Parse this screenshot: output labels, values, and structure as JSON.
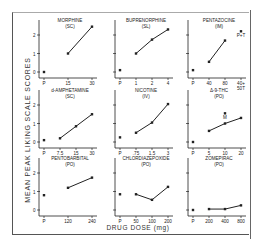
{
  "chart_data": {
    "type": "line",
    "layout": "3x3 small multiples",
    "ylabel": "MEAN PEAK LIKING SCALE SCORES",
    "xlabel": "DRUG DOSE (mg)",
    "ylim": [
      0,
      2.5
    ],
    "yticks": [
      0,
      1,
      2
    ],
    "grid": false,
    "panels": [
      {
        "title": "MORPHINE",
        "route": "(SC)",
        "x_ticks": [
          "P",
          "15",
          "30"
        ],
        "placebo": 0.0,
        "series": [
          {
            "x": "15",
            "y": 1.0
          },
          {
            "x": "30",
            "y": 2.45
          }
        ],
        "show_ytick_labels": true
      },
      {
        "title": "BUPRENORPHINE",
        "route": "(SL)",
        "x_ticks": [
          "P",
          "1",
          "2",
          "4"
        ],
        "placebo": 0.1,
        "series": [
          {
            "x": "1",
            "y": 1.0
          },
          {
            "x": "2",
            "y": 1.75
          },
          {
            "x": "4",
            "y": 2.3
          }
        ],
        "show_ytick_labels": false
      },
      {
        "title": "PENTAZOCINE",
        "route": "(IM)",
        "x_ticks": [
          "P",
          "40",
          "80",
          "40+\n50T"
        ],
        "placebo": 0.1,
        "series": [
          {
            "x": "40",
            "y": 0.55
          },
          {
            "x": "80",
            "y": 1.7
          }
        ],
        "extra_points": [
          {
            "x": "40+\n50T",
            "y": 2.2,
            "label": "P+T"
          }
        ],
        "show_ytick_labels": false
      },
      {
        "title": "d-AMPHETAMINE",
        "route": "(SC)",
        "x_ticks": [
          "P",
          "7.5",
          "15",
          "30"
        ],
        "placebo": 0.1,
        "series": [
          {
            "x": "7.5",
            "y": 0.2
          },
          {
            "x": "15",
            "y": 0.85
          },
          {
            "x": "30",
            "y": 1.5
          }
        ],
        "show_ytick_labels": true
      },
      {
        "title": "NICOTINE",
        "route": "(IV)",
        "x_ticks": [
          "P",
          ".75",
          "1.5",
          "3"
        ],
        "placebo": 0.25,
        "series": [
          {
            "x": ".75",
            "y": 0.5
          },
          {
            "x": "1.5",
            "y": 1.05
          },
          {
            "x": "3",
            "y": 2.05
          }
        ],
        "show_ytick_labels": false
      },
      {
        "title": "Δ-9-THC",
        "route": "(PO)",
        "x_ticks": [
          "P",
          "5",
          "10",
          "20"
        ],
        "placebo": 0.0,
        "series": [
          {
            "x": "5",
            "y": 0.6
          },
          {
            "x": "10",
            "y": 1.0
          },
          {
            "x": "20",
            "y": 1.3
          }
        ],
        "extra_points": [
          {
            "x": "10",
            "y": 1.55,
            "label": "M"
          }
        ],
        "show_ytick_labels": false
      },
      {
        "title": "PENTOBARBITAL",
        "route": "(PO)",
        "x_ticks": [
          "P",
          "120",
          "240"
        ],
        "placebo": 0.8,
        "series": [
          {
            "x": "120",
            "y": 1.2
          },
          {
            "x": "240",
            "y": 1.75
          }
        ],
        "show_ytick_labels": true
      },
      {
        "title": "CHLORDIAZEPOXIDE",
        "route": "(PO)",
        "x_ticks": [
          "P",
          "50",
          "100",
          "200"
        ],
        "placebo": 0.85,
        "series": [
          {
            "x": "50",
            "y": 0.85
          },
          {
            "x": "100",
            "y": 0.55
          },
          {
            "x": "200",
            "y": 1.25
          }
        ],
        "show_ytick_labels": false
      },
      {
        "title": "ZOMEPIRAC",
        "route": "(PO)",
        "x_ticks": [
          "P",
          "200",
          "400",
          "800"
        ],
        "placebo": 0.0,
        "series": [
          {
            "x": "200",
            "y": 0.05
          },
          {
            "x": "400",
            "y": 0.05
          },
          {
            "x": "800",
            "y": 0.25
          }
        ],
        "show_ytick_labels": false
      }
    ]
  }
}
